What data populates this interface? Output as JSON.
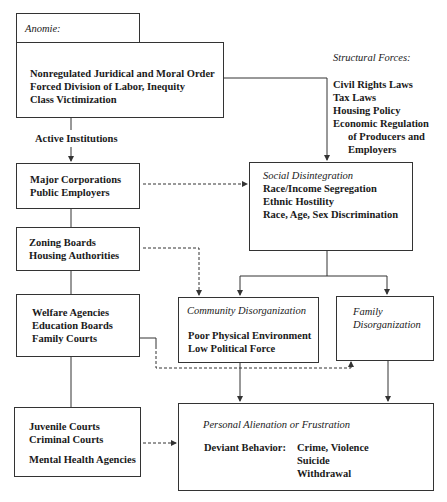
{
  "anomie": {
    "label": "Anomie:",
    "lines": [
      "Nonregulated Juridical and Moral Order",
      "Forced Division of Labor, Inequity",
      "Class Victimization"
    ]
  },
  "structural_forces": {
    "label": "Structural Forces:",
    "lines": [
      "Civil Rights Laws",
      "Tax Laws",
      "Housing Policy",
      "Economic Regulation",
      "of Producers and",
      "Employers"
    ]
  },
  "active_institutions": {
    "label": "Active Institutions",
    "boxes": [
      {
        "lines": [
          "Major Corporations",
          "Public Employers"
        ]
      },
      {
        "lines": [
          "Zoning Boards",
          "Housing Authorities"
        ]
      },
      {
        "lines": [
          "Welfare Agencies",
          "Education Boards",
          "Family Courts"
        ]
      },
      {
        "lines": [
          "Juvenile Courts",
          "Criminal Courts",
          "Mental Health Agencies"
        ]
      }
    ]
  },
  "social_disintegration": {
    "title": "Social Disintegration",
    "lines": [
      "Race/Income Segregation",
      "Ethnic Hostility",
      "Race, Age, Sex Discrimination"
    ]
  },
  "community_disorganization": {
    "title": "Community Disorganization",
    "lines": [
      "Poor Physical Environment",
      "Low Political Force"
    ]
  },
  "family_disorganization": {
    "title_lines": [
      "Family",
      "Disorganization"
    ]
  },
  "personal_alienation": {
    "title": "Personal Alienation or Frustration",
    "deviant_label": "Deviant Behavior:",
    "deviant_items": [
      "Crime, Violence",
      "Suicide",
      "Withdrawal"
    ]
  },
  "colors": {
    "line": "#333333",
    "background": "#ffffff",
    "text": "#1a1a1a"
  }
}
